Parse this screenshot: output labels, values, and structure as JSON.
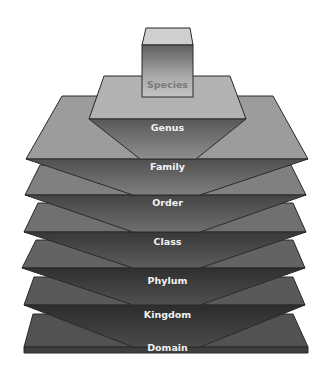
{
  "diagram": {
    "type": "taxonomy-pyramid",
    "levels": [
      {
        "name": "Species",
        "order": 1
      },
      {
        "name": "Genus",
        "order": 2
      },
      {
        "name": "Family",
        "order": 3
      },
      {
        "name": "Order",
        "order": 4
      },
      {
        "name": "Class",
        "order": 5
      },
      {
        "name": "Phylum",
        "order": 6
      },
      {
        "name": "Kingdom",
        "order": 7
      },
      {
        "name": "Domain",
        "order": 8
      }
    ]
  },
  "labels": {
    "species": "Species",
    "genus": "Genus",
    "family": "Family",
    "order": "Order",
    "class": "Class",
    "phylum": "Phylum",
    "kingdom": "Kingdom",
    "domain": "Domain"
  },
  "colors": {
    "outline": "#2a2a2a",
    "background": "#ffffff",
    "label_light": "#f2f2f2",
    "label_species": "#7a7a7a"
  }
}
